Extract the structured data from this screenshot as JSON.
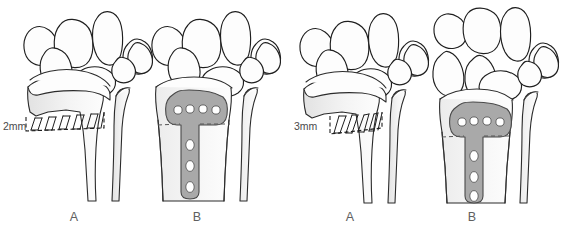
{
  "figure": {
    "background_color": "#ffffff",
    "width": 588,
    "height": 239,
    "illustration_style": "medical line drawing"
  },
  "colors": {
    "outline": "#2b2b2b",
    "carpal_outline": "#1f1f1f",
    "bone_fill": "#fdfdfd",
    "bone_shade": "#ececec",
    "plate_fill": "#a9a9a9",
    "plate_outline": "#4a4a4a",
    "hole_fill": "#ffffff",
    "label_text": "#606060",
    "measure_text": "#4a4a4a",
    "dash_line": "#555555"
  },
  "groups": [
    {
      "id": "left-group",
      "name": "two-millimetre-case",
      "panels": [
        {
          "id": "left-panel-a",
          "letter": "A",
          "letter_x": 74,
          "letter_y": 221,
          "content": "osteotomy wedge with measurement",
          "measurement": {
            "value": "2mm",
            "label_x": 3,
            "label_y": 130,
            "wedge_teeth": 11,
            "wedge_description": "hatched trapezoidal opening wedge across distal radius metaphysis"
          }
        },
        {
          "id": "left-panel-b",
          "letter": "B",
          "letter_x": 197,
          "letter_y": 221,
          "content": "T-plate fixation after osteotomy",
          "plate": {
            "shape": "T-plate",
            "transverse_holes": 4,
            "shaft_holes": 3,
            "osteotomy_line": "dashed transverse line at plate junction"
          }
        }
      ]
    },
    {
      "id": "right-group",
      "name": "three-millimetre-case",
      "panels": [
        {
          "id": "right-panel-a",
          "letter": "A",
          "letter_x": 350,
          "letter_y": 221,
          "content": "osteotomy wedge with measurement",
          "measurement": {
            "value": "3mm",
            "label_x": 294,
            "label_y": 130,
            "wedge_teeth": 11,
            "wedge_description": "hatched tapering opening wedge across distal radius metaphysis"
          }
        },
        {
          "id": "right-panel-b",
          "letter": "B",
          "letter_x": 472,
          "letter_y": 221,
          "content": "T-plate fixation after osteotomy",
          "plate": {
            "shape": "T-plate",
            "transverse_holes": 4,
            "shaft_holes": 3,
            "osteotomy_line": "dashed transverse line at plate junction"
          }
        }
      ]
    }
  ],
  "anatomy": {
    "bones_depicted": [
      "radius",
      "ulna",
      "scaphoid",
      "lunate",
      "triquetrum",
      "pisiform",
      "trapezium",
      "trapezoid",
      "capitate",
      "hamate"
    ],
    "carpal_row_count": 2
  }
}
